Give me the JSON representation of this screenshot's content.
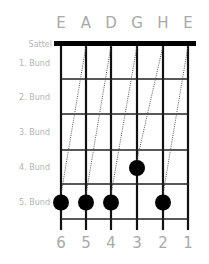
{
  "diagram": {
    "title_strings": [
      "E",
      "A",
      "D",
      "G",
      "H",
      "E"
    ],
    "string_numbers": [
      "6",
      "5",
      "4",
      "3",
      "2",
      "1"
    ],
    "nut_label": "Sattel",
    "fret_labels": [
      "1. Bund",
      "2. Bund",
      "3. Bund",
      "4. Bund",
      "5. Bund"
    ],
    "fret_count": 5,
    "fingerings": [
      {
        "string": 6,
        "fret": 5
      },
      {
        "string": 5,
        "fret": 5
      },
      {
        "string": 4,
        "fret": 5
      },
      {
        "string": 3,
        "fret": 4
      },
      {
        "string": 2,
        "fret": 5
      }
    ],
    "tuning_guides": [
      {
        "from_string": 6,
        "from_fret": 5,
        "to_string": 5
      },
      {
        "from_string": 5,
        "from_fret": 5,
        "to_string": 4
      },
      {
        "from_string": 4,
        "from_fret": 5,
        "to_string": 3
      },
      {
        "from_string": 3,
        "from_fret": 4,
        "to_string": 2
      },
      {
        "from_string": 2,
        "from_fret": 5,
        "to_string": 1
      }
    ],
    "colors": {
      "label": "#a9a9a9",
      "lines": "#111111",
      "dots": "#000000"
    }
  }
}
